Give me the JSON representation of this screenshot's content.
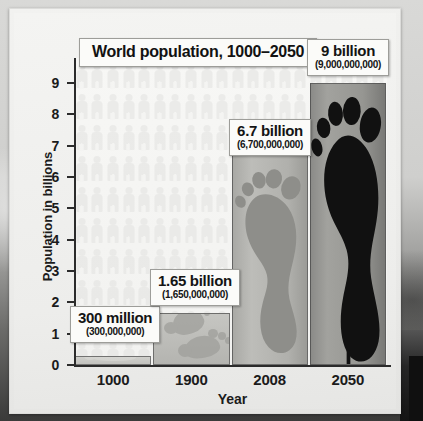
{
  "chart_data": {
    "type": "bar",
    "title": "World population, 1000–2050",
    "xlabel": "Year",
    "ylabel": "Population in billions",
    "categories": [
      "1000",
      "1900",
      "2008",
      "2050"
    ],
    "values": [
      0.3,
      1.65,
      6.7,
      9
    ],
    "value_labels": [
      {
        "big": "300 million",
        "small": "(300,000,000)"
      },
      {
        "big": "1.65 billion",
        "small": "(1,650,000,000)"
      },
      {
        "big": "6.7 billion",
        "small": "(6,700,000,000)"
      },
      {
        "big": "9 billion",
        "small": "(9,000,000,000)"
      }
    ],
    "ylim": [
      0,
      9.8
    ],
    "yticks": [
      "0",
      "1",
      "2",
      "3",
      "4",
      "5",
      "6",
      "7",
      "8",
      "9"
    ],
    "grid": false,
    "legend": "none"
  },
  "figure": {
    "title": "World population, 1000–2050",
    "y_axis_title": "Population in billions",
    "x_axis_title": "Year",
    "y_tick_labels": [
      "9",
      "8",
      "7",
      "6",
      "5",
      "4",
      "3",
      "2",
      "1",
      "0"
    ],
    "x_tick_labels": [
      "1000",
      "1900",
      "2008",
      "2050"
    ],
    "callouts": [
      {
        "big": "300 million",
        "small": "(300,000,000)"
      },
      {
        "big": "1.65 billion",
        "small": "(1,650,000,000)"
      },
      {
        "big": "6.7 billion",
        "small": "(6,700,000,000)"
      },
      {
        "big": "9 billion",
        "small": "(9,000,000,000)"
      }
    ]
  },
  "colors": {
    "page": "#f2f2f0",
    "axis": "#2b2b2b",
    "text": "#141414",
    "callout_bg": "#fbfbf9",
    "bar_1000": "#cfcfcb",
    "bar_1900": "#c6c6c2",
    "bar_2008": "#b0b0ac",
    "bar_2050": "#96 9692",
    "footprint_2008": "#8e8e8a",
    "footprint_2050": "#111111"
  }
}
